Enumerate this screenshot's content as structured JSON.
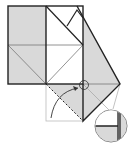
{
  "diagram": {
    "type": "origami-fold-step",
    "colors": {
      "paper_colored": "#d9d9d9",
      "paper_white": "#ffffff",
      "edge": "#222222",
      "crease": "#777777",
      "guide": "#bbbbbb",
      "arrow": "#333333"
    },
    "elements": {
      "square": "folded-square",
      "flap": "diamond-flap",
      "fold_arrow": "valley-fold-arrow",
      "detail_circle": "magnified-detail",
      "focus_circle": "focus-ring"
    }
  }
}
